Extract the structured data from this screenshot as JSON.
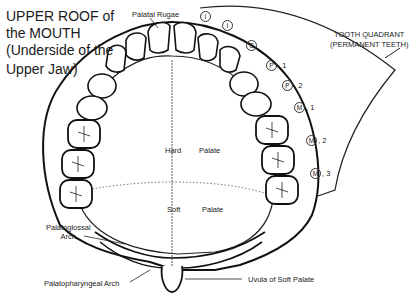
{
  "title": {
    "lines": [
      "UPPER ROOF of",
      "the MOUTH",
      "(Underside of the",
      "Upper Jaw)"
    ]
  },
  "labels": {
    "palatal_rugae": "Palatal Rugae",
    "tooth_quadrant_line1": "TOOTH QUADRANT",
    "tooth_quadrant_line2": "(PERMANENT TEETH)",
    "hard": "Hard",
    "hard_palate": "Palate",
    "soft": "Soft",
    "soft_palate": "Palate",
    "palatoglossal_line1": "Palatoglossal",
    "palatoglossal_line2": "Arch",
    "palatopharyngeal": "Palatopharyngeal Arch",
    "uvula": "Uvula of Soft Palate"
  },
  "teeth": [
    {
      "symbol": "I",
      "suffix": ""
    },
    {
      "symbol": "I",
      "suffix": ""
    },
    {
      "symbol": "C",
      "suffix": ""
    },
    {
      "symbol": "P",
      "suffix": ", 1"
    },
    {
      "symbol": "P",
      "suffix": ", 2"
    },
    {
      "symbol": "M",
      "suffix": ", 1"
    },
    {
      "symbol": "M",
      "suffix": ", 2"
    },
    {
      "symbol": "M",
      "suffix": ", 3"
    }
  ],
  "colors": {
    "ink": "#1a1a1a",
    "background": "#ffffff"
  }
}
